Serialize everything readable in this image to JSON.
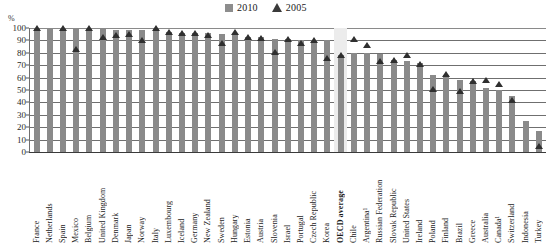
{
  "chart_data": {
    "type": "bar",
    "title": "",
    "xlabel": "",
    "ylabel": "%",
    "ylim": [
      0,
      100
    ],
    "yticks": [
      0,
      10,
      20,
      30,
      40,
      50,
      60,
      70,
      80,
      90,
      100
    ],
    "grid": true,
    "legend_position": "top-right",
    "legend": [
      {
        "name": "2010",
        "marker": "square",
        "color": "#8d8d8d"
      },
      {
        "name": "2005",
        "marker": "triangle",
        "color": "#3a3a3a"
      }
    ],
    "categories": [
      "France",
      "Netherlands",
      "Spain",
      "Mexico",
      "Belgium",
      "United Kingdom",
      "Denmark",
      "Japan",
      "Norway",
      "Italy",
      "Luxembourg",
      "Iceland",
      "Germany",
      "New Zealand",
      "Sweden",
      "Hungary",
      "Estonia",
      "Austria",
      "Slovenia",
      "Israel",
      "Portugal",
      "Czech Republic",
      "Korea",
      "OECD average",
      "Chile",
      "Argentina¹",
      "Russian Federation",
      "Slovak Republic",
      "United States",
      "Ireland",
      "Poland",
      "Finland",
      "Brazil",
      "Greece",
      "Australia",
      "Canada¹",
      "Switzerland",
      "Indonesia",
      "Turkey"
    ],
    "highlight_category": "OECD average",
    "series": [
      {
        "name": "2010",
        "values": [
          100,
          100,
          100,
          100,
          100,
          99,
          98,
          98,
          98,
          100,
          97,
          96,
          96,
          96,
          95,
          95,
          93,
          93,
          91,
          91,
          90,
          90,
          90,
          78,
          80,
          80,
          79,
          74,
          73,
          72,
          62,
          62,
          58,
          57,
          52,
          50,
          45,
          25,
          17
        ]
      },
      {
        "name": "2005",
        "values": [
          100,
          null,
          100,
          83,
          100,
          93,
          94,
          95,
          90,
          100,
          97,
          96,
          96,
          94,
          88,
          97,
          93,
          92,
          81,
          91,
          88,
          90,
          76,
          78,
          91,
          86,
          73,
          74,
          78,
          71,
          51,
          63,
          49,
          57,
          58,
          55,
          42,
          null,
          5
        ]
      }
    ]
  }
}
